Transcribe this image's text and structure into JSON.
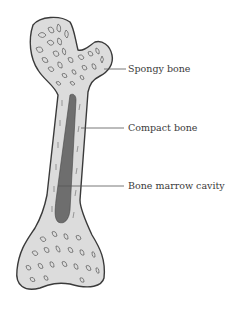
{
  "diagram": {
    "labels": [
      {
        "text": "Spongy bone",
        "target": "spongy-bone"
      },
      {
        "text": "Compact bone",
        "target": "compact-bone"
      },
      {
        "text": "Bone marrow cavity",
        "target": "marrow-cavity"
      }
    ]
  },
  "colors": {
    "outline": "#3a3a3a",
    "bone_fill": "#dcdcdc",
    "marrow_fill": "#6e6e6e",
    "text": "#3a3a3a",
    "background": "#ffffff"
  }
}
